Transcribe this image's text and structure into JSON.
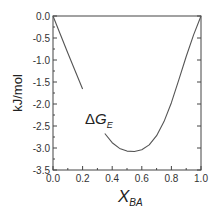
{
  "chart_data": {
    "type": "line",
    "title": "",
    "xlabel": "X_BA",
    "xlabel_main": "X",
    "xlabel_sub": "BA",
    "ylabel": "kJ/mol",
    "xlim": [
      0.0,
      1.0
    ],
    "ylim": [
      -3.5,
      0.0
    ],
    "grid": false,
    "legend": null,
    "x_ticks": [
      "0.0",
      "0.2",
      "0.4",
      "0.6",
      "0.8",
      "1.0"
    ],
    "y_ticks": [
      "0.0",
      "-0.5",
      "-1.0",
      "-1.5",
      "-2.0",
      "-2.5",
      "-3.0",
      "-3.5"
    ],
    "annotation": {
      "delta": "Δ",
      "main": "G",
      "sub": "E",
      "x": 0.25,
      "y": -2.4
    },
    "series": [
      {
        "name": "ΔG_E",
        "color": "#555555",
        "x": [
          0.0,
          0.05,
          0.1,
          0.15,
          0.2,
          0.25,
          0.3,
          0.35,
          0.4,
          0.45,
          0.5,
          0.55,
          0.6,
          0.65,
          0.7,
          0.75,
          0.8,
          0.85,
          0.9,
          0.95,
          1.0
        ],
        "values": [
          0.0,
          -0.42,
          -0.84,
          -1.25,
          -1.66,
          -2.03,
          -2.38,
          -2.67,
          -2.88,
          -3.01,
          -3.07,
          -3.08,
          -3.04,
          -2.93,
          -2.72,
          -2.4,
          -1.97,
          -1.45,
          -0.92,
          -0.43,
          0.0
        ]
      }
    ],
    "label_gap_x": [
      0.22,
      0.34
    ]
  }
}
